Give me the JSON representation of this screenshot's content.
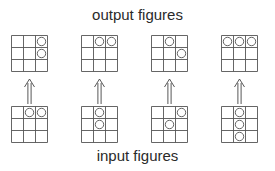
{
  "labels": {
    "top": "output figures",
    "bottom": "input figures"
  },
  "layout": {
    "grid_size": 3,
    "cell_px": 12,
    "columns_x": [
      11,
      81,
      151,
      221
    ],
    "output_y": 35,
    "input_y": 106,
    "arrow_top_y": 79,
    "arrow_bottom_y": 104
  },
  "pairs": [
    {
      "output": [
        [
          0,
          2
        ],
        [
          1,
          2
        ]
      ],
      "input": [
        [
          0,
          1
        ],
        [
          0,
          2
        ]
      ]
    },
    {
      "output": [
        [
          0,
          1
        ],
        [
          0,
          2
        ]
      ],
      "input": [
        [
          0,
          1
        ],
        [
          1,
          1
        ]
      ]
    },
    {
      "output": [
        [
          0,
          1
        ],
        [
          1,
          2
        ]
      ],
      "input": [
        [
          0,
          2
        ],
        [
          1,
          1
        ]
      ]
    },
    {
      "output": [
        [
          0,
          0
        ],
        [
          0,
          1
        ],
        [
          0,
          2
        ]
      ],
      "input": [
        [
          0,
          1
        ],
        [
          1,
          1
        ],
        [
          2,
          1
        ]
      ]
    }
  ],
  "colors": {
    "line": "#555555",
    "text": "#2a2a2a",
    "background": "#ffffff"
  }
}
